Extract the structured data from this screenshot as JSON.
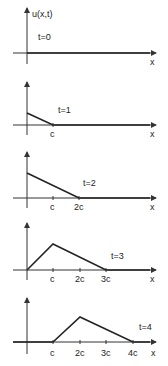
{
  "figure": {
    "y_label": "u(x,t)",
    "x_label": "x",
    "panels": [
      {
        "time_label": "t=0",
        "ticks": [],
        "profile": "zero"
      },
      {
        "time_label": "t=1",
        "ticks": [
          "c"
        ],
        "profile": "ramp down from u0/... to zero at c"
      },
      {
        "time_label": "t=2",
        "ticks": [
          "c",
          "2c"
        ],
        "profile": "ramp down to zero at 2c"
      },
      {
        "time_label": "t=3",
        "ticks": [
          "c",
          "2c",
          "3c"
        ],
        "profile": "rise to peak at c then down to zero at 3c"
      },
      {
        "time_label": "t=4",
        "ticks": [
          "c",
          "2c",
          "3c",
          "4c"
        ],
        "profile": "zero until c, peak at 2c, zero at 4c"
      }
    ]
  },
  "colors": {
    "line": "#222222",
    "axis": "#333333",
    "background": "#ffffff"
  }
}
